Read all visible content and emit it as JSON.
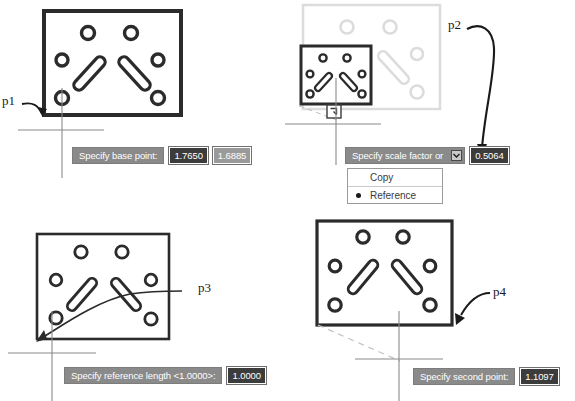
{
  "document": {
    "title": "SCALE command dynamic input sequence",
    "colors": {
      "prompt_background": "#8a8a8a",
      "prompt_text": "#ffffff",
      "field_background": "#9a9a9a",
      "field_selected_background": "#3c3c3c",
      "geometry_stroke": "#2b2b2b",
      "ghost_stroke": "#d8d8d8",
      "cursor_stroke": "#8a8a8a"
    }
  },
  "panels": [
    {
      "id": "panel-1",
      "point_label": "p1",
      "prompt": "Specify base point:",
      "fields": [
        {
          "value": "1.7650",
          "selected": true
        },
        {
          "value": "1.6885",
          "selected": false
        }
      ]
    },
    {
      "id": "panel-2",
      "point_label": "p2",
      "prompt": "Specify scale factor or",
      "dropdown_icon": "chevron-down-icon",
      "fields": [
        {
          "value": "0.5064",
          "selected": true
        }
      ],
      "options": [
        {
          "label": "Copy",
          "marked": false
        },
        {
          "label": "Reference",
          "marked": true
        }
      ]
    },
    {
      "id": "panel-3",
      "point_label": "p3",
      "prompt": "Specify reference length <1.0000>:",
      "fields": [
        {
          "value": "1.0000",
          "selected": true
        }
      ]
    },
    {
      "id": "panel-4",
      "point_label": "p4",
      "prompt": "Specify second point:",
      "fields": [
        {
          "value": "1.1097",
          "selected": true
        }
      ]
    }
  ]
}
